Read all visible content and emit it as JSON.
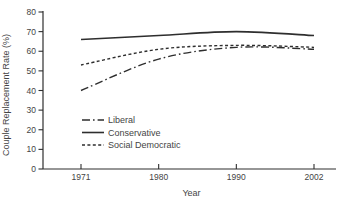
{
  "figure": {
    "background_color": "#ffffff",
    "line_color": "#2e2e2e",
    "text_color": "#444444"
  },
  "chart_data": {
    "type": "line",
    "x_categories": [
      "1971",
      "1980",
      "1990",
      "2002"
    ],
    "series": [
      {
        "name": "Liberal",
        "line_style": "dash-dot",
        "values": [
          40,
          56,
          62,
          61
        ]
      },
      {
        "name": "Conservative",
        "line_style": "solid",
        "values": [
          66,
          68,
          70,
          68
        ]
      },
      {
        "name": "Social Democratic",
        "line_style": "dashed",
        "values": [
          53,
          61,
          63,
          62
        ]
      }
    ],
    "title": "",
    "xlabel": "Year",
    "ylabel": "Couple Replacement Rate (%)",
    "ylim": [
      0,
      80
    ],
    "y_ticks": [
      0,
      10,
      20,
      30,
      40,
      50,
      60,
      70,
      80
    ],
    "grid": false,
    "legend_position": "inside-left-middle",
    "legend_entries": [
      "Liberal",
      "Conservative",
      "Social Democratic"
    ]
  }
}
